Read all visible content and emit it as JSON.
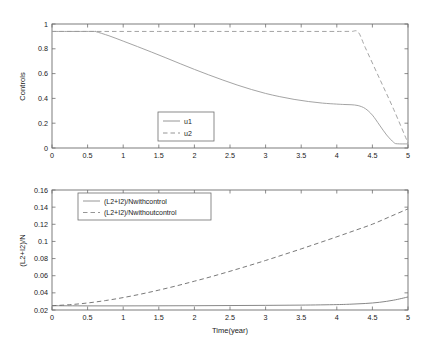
{
  "figure": {
    "background_color": "#ffffff",
    "axis_color": "#6e6e6e",
    "text_color": "#1a1a1a"
  },
  "chart_data": [
    {
      "id": "controls-plot",
      "type": "line",
      "title": "",
      "xlabel": "",
      "ylabel": "Controls",
      "xlim": [
        0,
        5
      ],
      "ylim": [
        0,
        1
      ],
      "grid": false,
      "legend_position": "lower-center-left",
      "xticks": [
        "0",
        "0.5",
        "1",
        "1.5",
        "2",
        "2.5",
        "3",
        "3.5",
        "4",
        "4.5",
        "5"
      ],
      "xtick_values": [
        0,
        0.5,
        1,
        1.5,
        2,
        2.5,
        3,
        3.5,
        4,
        4.5,
        5
      ],
      "yticks": [
        "0",
        "0.2",
        "0.4",
        "0.6",
        "0.8",
        "1"
      ],
      "ytick_values": [
        0,
        0.2,
        0.4,
        0.6,
        0.8,
        1
      ],
      "series": [
        {
          "name": "u1",
          "style": "solid",
          "color": "#9a9a9a",
          "x": [
            0,
            0.2,
            0.4,
            0.6,
            0.62,
            0.8,
            1.0,
            1.2,
            1.4,
            1.6,
            1.8,
            2.0,
            2.2,
            2.4,
            2.6,
            2.8,
            3.0,
            3.2,
            3.4,
            3.6,
            3.8,
            4.0,
            4.1,
            4.2,
            4.3,
            4.4,
            4.5,
            4.6,
            4.7,
            4.8,
            4.85,
            5.0
          ],
          "values": [
            0.94,
            0.94,
            0.94,
            0.94,
            0.938,
            0.905,
            0.862,
            0.818,
            0.773,
            0.727,
            0.68,
            0.634,
            0.59,
            0.548,
            0.508,
            0.472,
            0.44,
            0.414,
            0.392,
            0.375,
            0.362,
            0.354,
            0.351,
            0.349,
            0.342,
            0.318,
            0.265,
            0.185,
            0.105,
            0.045,
            0.034,
            0.033
          ]
        },
        {
          "name": "u2",
          "style": "dashed",
          "color": "#9a9a9a",
          "x": [
            0,
            0.5,
            1.0,
            1.5,
            2.0,
            2.5,
            3.0,
            3.5,
            4.0,
            4.2,
            4.3,
            4.4,
            4.6,
            4.8,
            5.0
          ],
          "values": [
            0.94,
            0.94,
            0.94,
            0.94,
            0.94,
            0.94,
            0.94,
            0.94,
            0.94,
            0.94,
            0.935,
            0.81,
            0.56,
            0.31,
            0.04
          ]
        }
      ],
      "legend_entries": [
        {
          "label": "u1",
          "style": "solid"
        },
        {
          "label": "u2",
          "style": "dashed"
        }
      ]
    },
    {
      "id": "prevalence-plot",
      "type": "line",
      "title": "",
      "xlabel": "Time(year)",
      "ylabel": "(L2+I2)/N",
      "xlim": [
        0,
        5
      ],
      "ylim": [
        0.02,
        0.16
      ],
      "grid": false,
      "legend_position": "upper-left",
      "xticks": [
        "0",
        "0.5",
        "1",
        "1.5",
        "2",
        "2.5",
        "3",
        "3.5",
        "4",
        "4.5",
        "5"
      ],
      "xtick_values": [
        0,
        0.5,
        1,
        1.5,
        2,
        2.5,
        3,
        3.5,
        4,
        4.5,
        5
      ],
      "yticks": [
        "0.02",
        "0.04",
        "0.06",
        "0.08",
        "0.1",
        "0.12",
        "0.14",
        "0.16"
      ],
      "ytick_values": [
        0.02,
        0.04,
        0.06,
        0.08,
        0.1,
        0.12,
        0.14,
        0.16
      ],
      "series": [
        {
          "name": "(L2+I2)/Nwithcontrol",
          "style": "solid",
          "color": "#7a7a7a",
          "x": [
            0,
            0.5,
            1.0,
            1.5,
            2.0,
            2.5,
            3.0,
            3.5,
            4.0,
            4.2,
            4.4,
            4.6,
            4.8,
            5.0
          ],
          "values": [
            0.025,
            0.0248,
            0.0248,
            0.0249,
            0.025,
            0.0252,
            0.0254,
            0.0257,
            0.0263,
            0.0268,
            0.0276,
            0.029,
            0.0315,
            0.0352
          ]
        },
        {
          "name": "(L2+I2)/Nwithoutcontrol",
          "style": "dashed",
          "color": "#6a6a6a",
          "x": [
            0,
            0.25,
            0.5,
            0.75,
            1.0,
            1.25,
            1.5,
            1.75,
            2.0,
            2.25,
            2.5,
            2.75,
            3.0,
            3.25,
            3.5,
            3.75,
            4.0,
            4.25,
            4.5,
            4.75,
            5.0
          ],
          "values": [
            0.025,
            0.0262,
            0.0282,
            0.031,
            0.0345,
            0.0386,
            0.0432,
            0.0482,
            0.0536,
            0.0592,
            0.0652,
            0.0714,
            0.0778,
            0.0845,
            0.0913,
            0.0983,
            0.1054,
            0.1127,
            0.1201,
            0.129,
            0.138
          ]
        }
      ],
      "legend_entries": [
        {
          "label": "(L2+I2)/Nwithcontrol",
          "style": "solid"
        },
        {
          "label": "(L2+I2)/Nwithoutcontrol",
          "style": "dashed"
        }
      ]
    }
  ]
}
